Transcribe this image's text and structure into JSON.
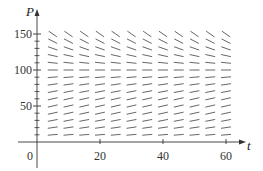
{
  "chart_data": {
    "type": "slope_field",
    "title": "",
    "xlabel": "t",
    "ylabel": "P",
    "xlim": [
      0,
      62
    ],
    "ylim": [
      0,
      160
    ],
    "x_ticks": [
      20,
      40,
      60
    ],
    "x_tick_labels": [
      "20",
      "40",
      "60"
    ],
    "y_ticks": [
      50,
      100,
      150
    ],
    "y_tick_labels": [
      "50",
      "100",
      "150"
    ],
    "y_minor_ticks": [
      10,
      20,
      30,
      40,
      60,
      70,
      80,
      90,
      110,
      120,
      130,
      140
    ],
    "origin_label": "0",
    "grid": false,
    "legend": null,
    "equation_model": "logistic: dP/dt = k P (1 - P/M)",
    "carrying_capacity": 100,
    "k": 0.04,
    "segment_t_values": [
      5,
      10,
      15,
      20,
      25,
      30,
      35,
      40,
      45,
      50,
      55,
      60
    ],
    "segment_P_values": [
      10,
      20,
      30,
      40,
      50,
      60,
      70,
      80,
      90,
      100,
      110,
      120,
      130,
      140,
      150
    ],
    "slopes_by_P": {
      "10": 0.36,
      "20": 0.64,
      "30": 0.84,
      "40": 0.96,
      "50": 1.0,
      "60": 0.96,
      "70": 0.84,
      "80": 0.64,
      "90": 0.36,
      "100": 0.0,
      "110": -0.44,
      "120": -0.96,
      "130": -1.56,
      "140": -2.24,
      "150": -3.0
    }
  },
  "layout": {
    "origin_px": [
      37,
      142
    ],
    "px_per_t": 3.15,
    "px_per_P": 0.72,
    "segment_length_px": 10,
    "axis_color": "#333333",
    "segment_color": "#555555"
  }
}
